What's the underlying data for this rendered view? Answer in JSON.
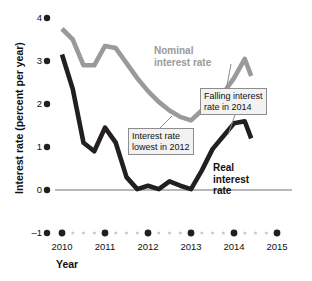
{
  "chart_data": {
    "type": "line",
    "title": "",
    "xlabel": "Year",
    "ylabel": "Interest rate (percent per year)",
    "xlim": [
      2009.65,
      2015.2
    ],
    "ylim": [
      -1,
      4
    ],
    "yticks": [
      4,
      3,
      2,
      1,
      0
    ],
    "ytick_labels": [
      "4",
      "3",
      "2",
      "1",
      "0"
    ],
    "y_axis_bottom_label": "–1",
    "xticks": [
      2010,
      2011,
      2012,
      2013,
      2014,
      2015
    ],
    "xtick_labels": [
      "2010",
      "2011",
      "2012",
      "2013",
      "2014",
      "2015"
    ],
    "grid": false,
    "zero_line": true,
    "legend_position": "inline-annotations",
    "series": [
      {
        "name": "Nominal interest rate",
        "color": "#9a9a9a",
        "x": [
          2010.0,
          2010.25,
          2010.5,
          2010.75,
          2011.0,
          2011.25,
          2011.5,
          2011.75,
          2012.0,
          2012.25,
          2012.5,
          2012.75,
          2013.0,
          2013.25,
          2013.5,
          2013.75,
          2014.0,
          2014.25,
          2014.4
        ],
        "values": [
          3.75,
          3.5,
          2.9,
          2.9,
          3.35,
          3.3,
          2.95,
          2.6,
          2.3,
          2.05,
          1.85,
          1.7,
          1.62,
          1.85,
          1.85,
          2.25,
          2.6,
          3.05,
          2.65
        ]
      },
      {
        "name": "Real interest rate",
        "color": "#231f20",
        "x": [
          2010.0,
          2010.25,
          2010.5,
          2010.75,
          2011.0,
          2011.25,
          2011.5,
          2011.75,
          2012.0,
          2012.25,
          2012.5,
          2012.75,
          2013.0,
          2013.25,
          2013.5,
          2013.75,
          2014.0,
          2014.25,
          2014.4
        ],
        "values": [
          3.15,
          2.35,
          1.1,
          0.9,
          1.45,
          1.1,
          0.3,
          0.02,
          0.1,
          0.02,
          0.2,
          0.1,
          0.02,
          0.45,
          0.95,
          1.25,
          1.55,
          1.6,
          1.2
        ]
      }
    ],
    "annotations": [
      {
        "id": "lowest-2012",
        "text_line1": "Interest rate",
        "text_line2": "lowest in 2012"
      },
      {
        "id": "falling-2014",
        "text_line1": "Falling interest",
        "text_line2": "rate in 2014"
      }
    ],
    "series_labels": {
      "nominal_line1": "Nominal",
      "nominal_line2": "interest rate",
      "real_line1": "Real",
      "real_line2": "interest",
      "real_line3": "rate"
    },
    "colors": {
      "nominal": "#9a9a9a",
      "real": "#231f20",
      "axis_dot": "#231f20",
      "minor_dot": "#c9c9c9",
      "zero_line": "#b8b8b8",
      "callout_bg": "#f2f2f2",
      "callout_border": "#8d8d8d"
    }
  }
}
